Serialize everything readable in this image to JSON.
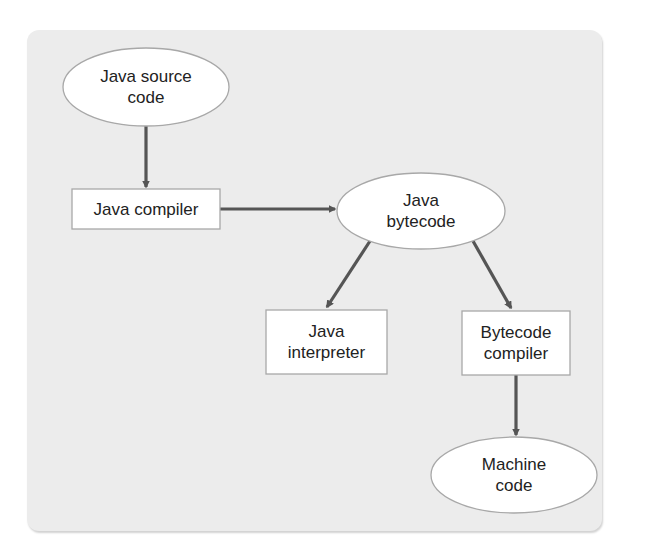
{
  "diagram": {
    "colors": {
      "panel_background": "#ececec",
      "node_fill": "#ffffff",
      "node_stroke": "#a8a8a8",
      "arrow": "#555555",
      "text": "#222222"
    },
    "nodes": [
      {
        "id": "java-source-code",
        "shape": "ellipse",
        "label": "Java source\ncode"
      },
      {
        "id": "java-compiler",
        "shape": "rectangle",
        "label": "Java compiler"
      },
      {
        "id": "java-bytecode",
        "shape": "ellipse",
        "label": "Java\nbytecode"
      },
      {
        "id": "java-interpreter",
        "shape": "rectangle",
        "label": "Java\ninterpreter"
      },
      {
        "id": "bytecode-compiler",
        "shape": "rectangle",
        "label": "Bytecode\ncompiler"
      },
      {
        "id": "machine-code",
        "shape": "ellipse",
        "label": "Machine\ncode"
      }
    ],
    "edges": [
      {
        "from": "java-source-code",
        "to": "java-compiler"
      },
      {
        "from": "java-compiler",
        "to": "java-bytecode"
      },
      {
        "from": "java-bytecode",
        "to": "java-interpreter"
      },
      {
        "from": "java-bytecode",
        "to": "bytecode-compiler"
      },
      {
        "from": "bytecode-compiler",
        "to": "machine-code"
      }
    ]
  }
}
